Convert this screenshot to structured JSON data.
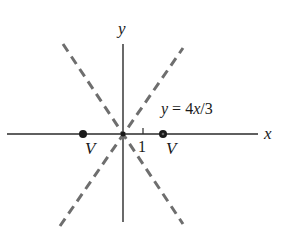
{
  "diagram": {
    "axes": {
      "x_label": "x",
      "y_label": "y",
      "tick_label": "1",
      "color": "#2a2a2a"
    },
    "asymptotes": {
      "color": "#6e6e6e",
      "label_prefix": "y = ",
      "label_expr": "4x/3",
      "label_full": "y = 4x/3"
    },
    "vertices": [
      {
        "label": "V",
        "x": -2
      },
      {
        "label": "V",
        "x": 2
      }
    ],
    "point_color": "#1a1a1a"
  }
}
